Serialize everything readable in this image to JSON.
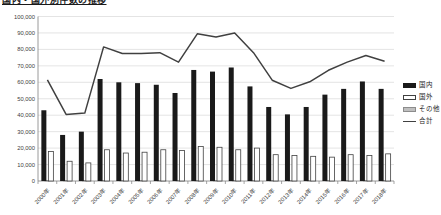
{
  "title": {
    "text": "国内・国外別件数の推移",
    "clipped": true
  },
  "legend": [
    {
      "label": "国内",
      "swatch": "black-bar"
    },
    {
      "label": "国外",
      "swatch": "white-bar"
    },
    {
      "label": "その他",
      "swatch": "gray-bar"
    },
    {
      "label": "合計",
      "swatch": "line"
    }
  ],
  "colors": {
    "bar_domestic": "#1a1a1a",
    "bar_foreign_fill": "#ffffff",
    "bar_foreign_stroke": "#404040",
    "bar_other_fill": "#bfbfbf",
    "bar_other_stroke": "#8c8c8c",
    "total_line": "#404040",
    "gridline": "#d9d9d9",
    "axis": "#808080",
    "axis_text": "#404040"
  },
  "chart_data": {
    "type": "bar",
    "subtype": "grouped-bars-with-total-line",
    "categories": [
      "2000年",
      "2001年",
      "2002年",
      "2003年",
      "2004年",
      "2005年",
      "2006年",
      "2007年",
      "2008年",
      "2009年",
      "2010年",
      "2011年",
      "2012年",
      "2013年",
      "2014年",
      "2015年",
      "2016年",
      "2017年",
      "2018年"
    ],
    "series": [
      {
        "name": "国内",
        "type": "bar",
        "values": [
          43000,
          28000,
          30000,
          62000,
          60000,
          59500,
          58500,
          53500,
          67500,
          66500,
          69000,
          57500,
          45000,
          40500,
          45000,
          52500,
          56000,
          60500,
          56000
        ]
      },
      {
        "name": "国外",
        "type": "bar",
        "values": [
          18000,
          12000,
          11000,
          19000,
          17000,
          17500,
          19000,
          18500,
          21000,
          20500,
          19000,
          20000,
          16000,
          15500,
          15000,
          14500,
          16000,
          15500,
          16500
        ]
      },
      {
        "name": "その他",
        "type": "bar",
        "values": [
          300,
          300,
          300,
          300,
          300,
          300,
          300,
          300,
          300,
          300,
          300,
          300,
          300,
          300,
          300,
          300,
          300,
          300,
          300
        ]
      },
      {
        "name": "合計",
        "type": "line",
        "values": [
          61500,
          40500,
          41300,
          81500,
          77500,
          77500,
          78000,
          72200,
          89500,
          87500,
          90000,
          78000,
          61300,
          56300,
          60300,
          67300,
          72300,
          76300,
          72800
        ]
      }
    ],
    "ylim": [
      0,
      100000
    ],
    "ytick_interval": 10000,
    "yticks": [
      "0",
      "10,000",
      "20,000",
      "30,000",
      "40,000",
      "50,000",
      "60,000",
      "70,000",
      "80,000",
      "90,000",
      "100,000"
    ],
    "xlabel": "",
    "ylabel": "",
    "grid": true,
    "legend_position": "right"
  }
}
